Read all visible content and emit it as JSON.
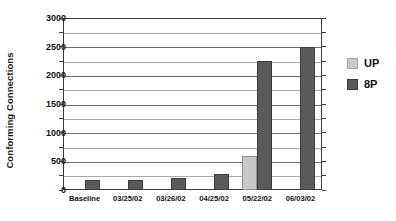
{
  "chart_data": {
    "type": "bar",
    "title": "",
    "xlabel": "",
    "ylabel": "Conforming Connections",
    "ylim": [
      0,
      3000
    ],
    "ytick_step": 500,
    "minor_gridline_step": 250,
    "grid": true,
    "legend_position": "right",
    "categories": [
      "Baseline",
      "03/25/02",
      "03/26/02",
      "04/25/02",
      "05/22/02",
      "06/03/02"
    ],
    "yticks": [
      "0",
      "500",
      "1000",
      "1500",
      "2000",
      "2500",
      "3000"
    ],
    "series": [
      {
        "name": "UP",
        "color": "#c9c9c9",
        "values": [
          0,
          0,
          0,
          0,
          600,
          0
        ]
      },
      {
        "name": "8P",
        "color": "#5a5a5a",
        "values": [
          180,
          180,
          215,
          275,
          2250,
          2500
        ]
      }
    ]
  },
  "legend": {
    "items": [
      {
        "label": "UP",
        "color": "#c9c9c9"
      },
      {
        "label": "8P",
        "color": "#5a5a5a"
      }
    ]
  }
}
